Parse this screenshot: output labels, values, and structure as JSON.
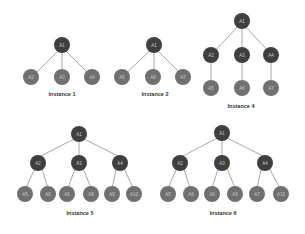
{
  "diagram": {
    "title": "",
    "colors": {
      "internal_node": "#3f3f3f",
      "leaf_node": "#707070",
      "edge": "#a8a8a8",
      "node_text": "#c8c8c8",
      "caption_text": "#333333"
    },
    "instances": [
      {
        "caption": "Instance 1",
        "nodes": [
          {
            "id": "r",
            "label": "A1",
            "type": "internal"
          },
          {
            "id": "c1",
            "label": "A2",
            "type": "leaf"
          },
          {
            "id": "c2",
            "label": "A3",
            "type": "leaf"
          },
          {
            "id": "c3",
            "label": "A4",
            "type": "leaf"
          }
        ],
        "edges": [
          [
            "c1",
            "r"
          ],
          [
            "c2",
            "r"
          ],
          [
            "c3",
            "r"
          ]
        ]
      },
      {
        "caption": "Instance 2",
        "nodes": [
          {
            "id": "r",
            "label": "A1",
            "type": "internal"
          },
          {
            "id": "c1",
            "label": "A5",
            "type": "leaf"
          },
          {
            "id": "c2",
            "label": "A6",
            "type": "leaf"
          },
          {
            "id": "c3",
            "label": "A7",
            "type": "leaf"
          }
        ],
        "edges": [
          [
            "c1",
            "r"
          ],
          [
            "c2",
            "r"
          ],
          [
            "c3",
            "r"
          ]
        ]
      },
      {
        "caption": "Instance 4",
        "nodes": [
          {
            "id": "r",
            "label": "A1",
            "type": "internal"
          },
          {
            "id": "m1",
            "label": "A2",
            "type": "internal"
          },
          {
            "id": "m2",
            "label": "A3",
            "type": "internal"
          },
          {
            "id": "m3",
            "label": "A4",
            "type": "internal"
          },
          {
            "id": "l1",
            "label": "A5",
            "type": "leaf"
          },
          {
            "id": "l2",
            "label": "A6",
            "type": "leaf"
          },
          {
            "id": "l3",
            "label": "A7",
            "type": "leaf"
          }
        ],
        "edges": [
          [
            "m1",
            "r"
          ],
          [
            "m2",
            "r"
          ],
          [
            "m3",
            "r"
          ],
          [
            "l1",
            "m1"
          ],
          [
            "l2",
            "m2"
          ],
          [
            "l3",
            "m3"
          ]
        ]
      },
      {
        "caption": "Instance 5",
        "nodes": [
          {
            "id": "r",
            "label": "A1",
            "type": "internal"
          },
          {
            "id": "m1",
            "label": "A2",
            "type": "internal"
          },
          {
            "id": "m2",
            "label": "A3",
            "type": "internal"
          },
          {
            "id": "m3",
            "label": "A4",
            "type": "internal"
          },
          {
            "id": "l1",
            "label": "A5",
            "type": "leaf"
          },
          {
            "id": "l2",
            "label": "A6",
            "type": "leaf"
          },
          {
            "id": "l3",
            "label": "A6",
            "type": "leaf"
          },
          {
            "id": "l4",
            "label": "A8",
            "type": "leaf"
          },
          {
            "id": "l5",
            "label": "A9",
            "type": "leaf"
          },
          {
            "id": "l6",
            "label": "A10",
            "type": "leaf"
          }
        ],
        "edges": [
          [
            "m1",
            "r"
          ],
          [
            "m2",
            "r"
          ],
          [
            "m3",
            "r"
          ],
          [
            "l1",
            "m1"
          ],
          [
            "l2",
            "m1"
          ],
          [
            "l3",
            "m2"
          ],
          [
            "l4",
            "m2"
          ],
          [
            "l5",
            "m3"
          ],
          [
            "l6",
            "m3"
          ]
        ]
      },
      {
        "caption": "Instance 6",
        "nodes": [
          {
            "id": "r",
            "label": "A1",
            "type": "internal"
          },
          {
            "id": "m1",
            "label": "A2",
            "type": "internal"
          },
          {
            "id": "m2",
            "label": "A3",
            "type": "internal"
          },
          {
            "id": "m3",
            "label": "A4",
            "type": "internal"
          },
          {
            "id": "l1",
            "label": "A5",
            "type": "leaf"
          },
          {
            "id": "l2",
            "label": "A6",
            "type": "leaf"
          },
          {
            "id": "l3",
            "label": "A6",
            "type": "leaf"
          },
          {
            "id": "l4",
            "label": "A9",
            "type": "leaf"
          },
          {
            "id": "l5",
            "label": "A7",
            "type": "leaf"
          },
          {
            "id": "l6",
            "label": "A10",
            "type": "leaf"
          }
        ],
        "edges": [
          [
            "m1",
            "r"
          ],
          [
            "m2",
            "r"
          ],
          [
            "m3",
            "r"
          ],
          [
            "l1",
            "m1"
          ],
          [
            "l2",
            "m1"
          ],
          [
            "l3",
            "m2"
          ],
          [
            "l4",
            "m2"
          ],
          [
            "l5",
            "m3"
          ],
          [
            "l6",
            "m3"
          ]
        ]
      }
    ]
  }
}
